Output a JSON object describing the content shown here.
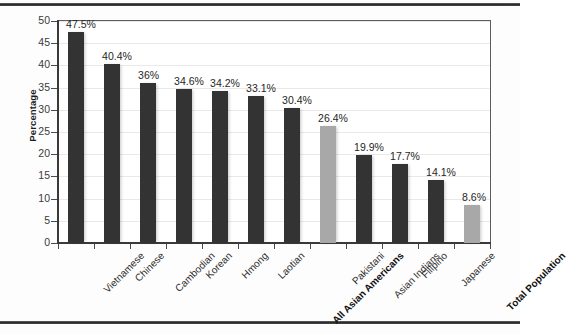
{
  "figure": {
    "title": "",
    "y_axis_title": "Percentage"
  },
  "chart_data": {
    "type": "bar",
    "title": "",
    "xlabel": "",
    "ylabel": "Percentage",
    "ylim": [
      0,
      50
    ],
    "ytick_step": 5,
    "grid": true,
    "legend": "none",
    "colors": {
      "primary_bar": "#333333",
      "highlight_bar": "#a8a8a8",
      "axis": "#3a3a3a",
      "gridline": "#e9e9e9"
    },
    "ytick_labels": [
      "0",
      "5",
      "10",
      "15",
      "20",
      "25",
      "30",
      "35",
      "40",
      "45",
      "50"
    ],
    "categories": [
      "Vietnamese",
      "Chinese",
      "Cambodian",
      "Korean",
      "Hmong",
      "Laotian",
      "All Asian Americans",
      "Pakistani",
      "Asian Indians",
      "Filipino",
      "Japanese",
      "Total Population"
    ],
    "values": [
      47.5,
      40.4,
      36,
      34.6,
      34.2,
      33.1,
      30.4,
      26.4,
      19.9,
      17.7,
      14.1,
      8.6
    ],
    "value_labels": [
      "47.5%",
      "40.4%",
      "36%",
      "34.6%",
      "34.2%",
      "33.1%",
      "30.4%",
      "26.4%",
      "19.9%",
      "17.7%",
      "14.1%",
      "8.6%"
    ],
    "bar_styles": [
      "dark",
      "dark",
      "dark",
      "dark",
      "dark",
      "dark",
      "dark",
      "light",
      "dark",
      "dark",
      "dark",
      "light"
    ],
    "label_emphasis": [
      false,
      false,
      false,
      false,
      false,
      false,
      true,
      false,
      false,
      false,
      false,
      true
    ]
  }
}
